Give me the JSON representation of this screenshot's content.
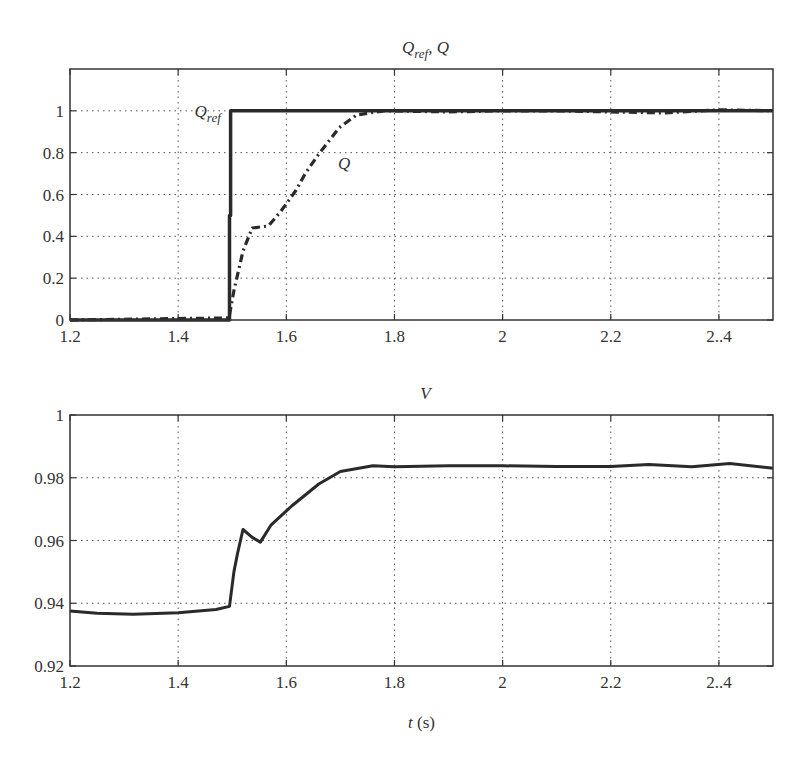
{
  "chart_data": [
    {
      "type": "line",
      "title": "Q_ref, Q",
      "title_main": "Q",
      "title_sub": "ref",
      "title_tail": ", Q",
      "xlabel": "",
      "ylabel": "",
      "xlim": [
        1.2,
        2.5
      ],
      "ylim": [
        0,
        1.2
      ],
      "grid": true,
      "x_ticks": [
        1.2,
        1.4,
        1.6,
        1.8,
        2,
        2.2,
        2.4
      ],
      "x_tick_labels": [
        "1.2",
        "1.4",
        "1.6",
        "1.8",
        "2",
        "2.2",
        "2..4"
      ],
      "y_ticks": [
        0,
        0.2,
        0.4,
        0.6,
        0.8,
        1
      ],
      "y_tick_labels": [
        "0",
        "0.2",
        "0.4",
        "0.6",
        "0.8",
        "1"
      ],
      "annotations": [
        {
          "text_main": "Q",
          "text_sub": "ref",
          "x": 1.49,
          "y": 1.0
        },
        {
          "text_main": "Q",
          "text_sub": "",
          "x": 1.705,
          "y": 0.75
        }
      ],
      "series": [
        {
          "name": "Q_ref",
          "style": "solid-thick",
          "x": [
            1.2,
            1.495,
            1.495,
            1.497,
            1.497,
            2.5
          ],
          "y": [
            0,
            0,
            0.5,
            0.5,
            1.0,
            1.0
          ]
        },
        {
          "name": "Q",
          "style": "dash-dot",
          "x": [
            1.2,
            1.494,
            1.503,
            1.52,
            1.537,
            1.567,
            1.59,
            1.618,
            1.635,
            1.659,
            1.698,
            1.73,
            1.78,
            1.9,
            2.0,
            2.1,
            2.2,
            2.3,
            2.4,
            2.5
          ],
          "y": [
            0,
            0.01,
            0.14,
            0.33,
            0.44,
            0.45,
            0.52,
            0.62,
            0.7,
            0.79,
            0.92,
            0.98,
            1.0,
            0.995,
            1.0,
            1.0,
            0.995,
            0.99,
            1.005,
            1.0
          ]
        }
      ]
    },
    {
      "type": "line",
      "title": "V",
      "xlabel": "t (s)",
      "xlabel_main": "t",
      "xlabel_unit": " (s)",
      "ylabel": "",
      "xlim": [
        1.2,
        2.5
      ],
      "ylim": [
        0.92,
        1.0
      ],
      "grid": true,
      "x_ticks": [
        1.2,
        1.4,
        1.6,
        1.8,
        2,
        2.2,
        2.4
      ],
      "x_tick_labels": [
        "1.2",
        "1.4",
        "1.6",
        "1.8",
        "2",
        "2.2",
        "2..4"
      ],
      "y_ticks": [
        0.92,
        0.94,
        0.96,
        0.98,
        1
      ],
      "y_tick_labels": [
        "0.92",
        "0.94",
        "0.96",
        "0.98",
        "1"
      ],
      "series": [
        {
          "name": "V",
          "style": "solid",
          "x": [
            1.2,
            1.25,
            1.317,
            1.4,
            1.47,
            1.495,
            1.503,
            1.51,
            1.52,
            1.537,
            1.552,
            1.572,
            1.61,
            1.66,
            1.7,
            1.76,
            1.8,
            1.9,
            2.0,
            2.1,
            2.2,
            2.27,
            2.35,
            2.42,
            2.5
          ],
          "y": [
            0.9375,
            0.9368,
            0.9365,
            0.937,
            0.938,
            0.939,
            0.95,
            0.956,
            0.9635,
            0.961,
            0.9595,
            0.965,
            0.971,
            0.978,
            0.982,
            0.9838,
            0.9835,
            0.9838,
            0.9838,
            0.9836,
            0.9836,
            0.9842,
            0.9835,
            0.9845,
            0.983
          ]
        }
      ]
    }
  ]
}
